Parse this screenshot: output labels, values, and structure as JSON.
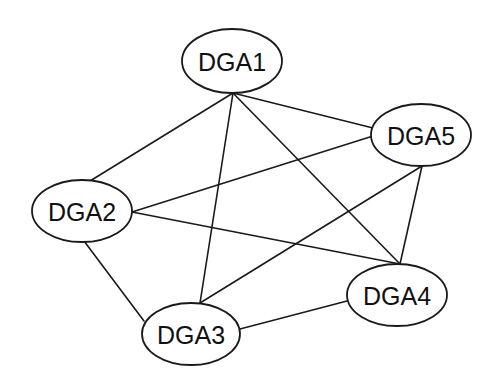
{
  "diagram": {
    "type": "fully-connected network graph",
    "colors": {
      "background": "#ffffff",
      "stroke": "#1a1a1a",
      "text": "#111111"
    },
    "nodes": [
      {
        "id": "DGA1",
        "label": "DGA1",
        "cx": 232,
        "cy": 61,
        "rx": 50,
        "ry": 32
      },
      {
        "id": "DGA2",
        "label": "DGA2",
        "cx": 82,
        "cy": 211,
        "rx": 50,
        "ry": 31
      },
      {
        "id": "DGA3",
        "label": "DGA3",
        "cx": 191,
        "cy": 334,
        "rx": 49,
        "ry": 31
      },
      {
        "id": "DGA4",
        "label": "DGA4",
        "cx": 397,
        "cy": 295,
        "rx": 50,
        "ry": 31
      },
      {
        "id": "DGA5",
        "label": "DGA5",
        "cx": 421,
        "cy": 135,
        "rx": 50,
        "ry": 31
      }
    ],
    "edges": [
      {
        "from": "DGA1",
        "to": "DGA2",
        "x1": 233,
        "y1": 93,
        "x2": 90,
        "y2": 181
      },
      {
        "from": "DGA1",
        "to": "DGA3",
        "x1": 233,
        "y1": 93,
        "x2": 200,
        "y2": 303
      },
      {
        "from": "DGA1",
        "to": "DGA4",
        "x1": 233,
        "y1": 93,
        "x2": 400,
        "y2": 264
      },
      {
        "from": "DGA1",
        "to": "DGA5",
        "x1": 233,
        "y1": 93,
        "x2": 373,
        "y2": 128
      },
      {
        "from": "DGA2",
        "to": "DGA5",
        "x1": 132,
        "y1": 212,
        "x2": 373,
        "y2": 136
      },
      {
        "from": "DGA2",
        "to": "DGA4",
        "x1": 132,
        "y1": 212,
        "x2": 400,
        "y2": 264
      },
      {
        "from": "DGA2",
        "to": "DGA3",
        "x1": 84,
        "y1": 241,
        "x2": 144,
        "y2": 321
      },
      {
        "from": "DGA3",
        "to": "DGA5",
        "x1": 200,
        "y1": 303,
        "x2": 422,
        "y2": 166
      },
      {
        "from": "DGA3",
        "to": "DGA4",
        "x1": 240,
        "y1": 329,
        "x2": 347,
        "y2": 301
      },
      {
        "from": "DGA5",
        "to": "DGA4",
        "x1": 422,
        "y1": 166,
        "x2": 400,
        "y2": 264
      }
    ]
  }
}
